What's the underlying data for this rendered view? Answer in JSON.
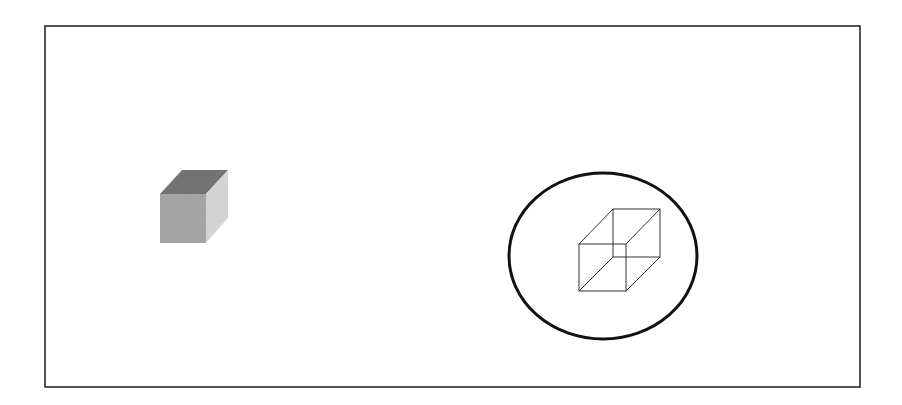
{
  "diagram": {
    "frame": {
      "x": 45,
      "y": 26,
      "width": 815,
      "height": 361,
      "stroke": "#2a2a2a"
    },
    "solid_cube": {
      "front_color": "#a9a9a9",
      "top_color": "#767676",
      "side_color": "#dadada"
    },
    "ellipse": {
      "cx": 603,
      "cy": 256,
      "rx": 94,
      "ry": 83,
      "stroke": "#111111"
    },
    "wireframe_cube": {
      "stroke": "#333333"
    }
  }
}
